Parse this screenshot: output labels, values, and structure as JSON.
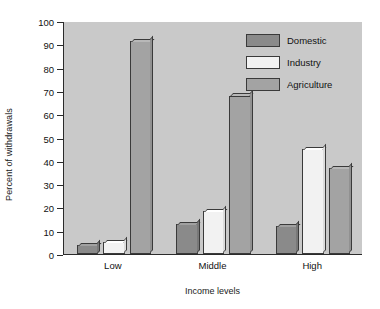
{
  "chart_data": {
    "type": "bar",
    "title": "",
    "xlabel": "Income levels",
    "ylabel": "Percent of withdrawals",
    "categories": [
      "Low",
      "Middle",
      "High"
    ],
    "series": [
      {
        "name": "Domestic",
        "values": [
          4,
          13,
          12
        ],
        "color": "#8a8a8a"
      },
      {
        "name": "Industry",
        "values": [
          5,
          18.5,
          45
        ],
        "color": "#f2f2f2"
      },
      {
        "name": "Agriculture",
        "values": [
          91.5,
          68,
          37
        ],
        "color": "#a3a3a3"
      }
    ],
    "ylim": [
      0,
      100
    ],
    "yticks": [
      0,
      10,
      20,
      30,
      40,
      50,
      60,
      70,
      80,
      90,
      100
    ],
    "ytick_labels": [
      "0",
      "10",
      "20",
      "30",
      "40",
      "50",
      "60",
      "70",
      "80",
      "90",
      "100"
    ],
    "grid": false,
    "legend_position": "top-right",
    "legend_entries": [
      "Domestic",
      "Industry",
      "Agriculture"
    ],
    "plot_background": "#c9c9c9",
    "figure_background": "#ffffff",
    "axis_color": "#2b2b2b"
  }
}
